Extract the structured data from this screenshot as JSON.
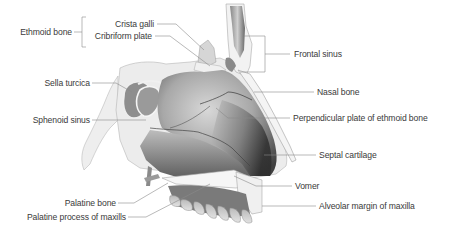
{
  "diagram": {
    "type": "anatomical illustration",
    "colors": {
      "label_text": "#3a3a3a",
      "leader_line": "#8a8a8a",
      "bone_fill": "#9a9a9a",
      "bone_dark": "#4a4a4a",
      "bone_light": "#e6e6e6"
    },
    "group_label": {
      "text": "Ethmoid bone",
      "members": [
        "Crista galli",
        "Cribriform plate"
      ]
    },
    "labels_left": [
      {
        "id": "crista-galli",
        "text": "Crista galli"
      },
      {
        "id": "cribriform-plate",
        "text": "Cribriform plate"
      },
      {
        "id": "sella-turcica",
        "text": "Sella turcica"
      },
      {
        "id": "sphenoid-sinus",
        "text": "Sphenoid sinus"
      },
      {
        "id": "palatine-bone",
        "text": "Palatine bone"
      },
      {
        "id": "palatine-process",
        "text": "Palatine process of maxills"
      }
    ],
    "labels_right": [
      {
        "id": "frontal-sinus",
        "text": "Frontal sinus"
      },
      {
        "id": "nasal-bone",
        "text": "Nasal bone"
      },
      {
        "id": "perpendicular-plate",
        "text": "Perpendicular plate of ethmoid bone"
      },
      {
        "id": "septal-cartilage",
        "text": "Septal cartilage"
      },
      {
        "id": "vomer",
        "text": "Vomer"
      },
      {
        "id": "alveolar-margin",
        "text": "Alveolar margin of maxilla"
      }
    ]
  }
}
